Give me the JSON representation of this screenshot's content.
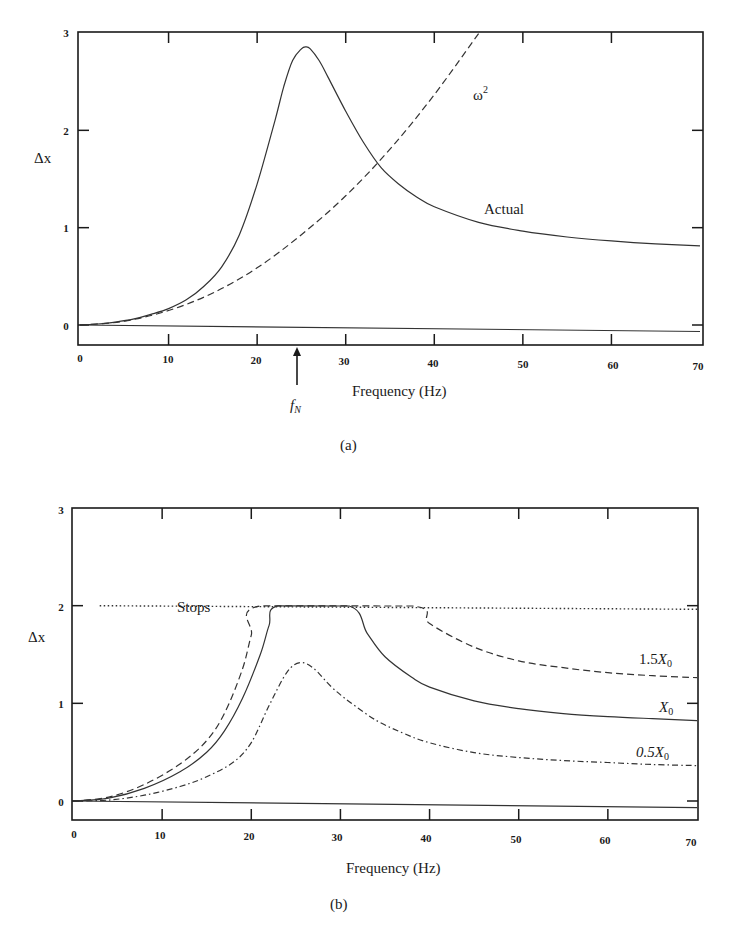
{
  "chart_data": [
    {
      "panel": "(a)",
      "type": "line",
      "title": "",
      "xlabel": "Frequency (Hz)",
      "ylabel": "Δx",
      "xlim": [
        0,
        70
      ],
      "ylim": [
        -0.2,
        3
      ],
      "xticks": [
        0,
        10,
        20,
        30,
        40,
        50,
        60,
        70
      ],
      "yticks": [
        0,
        1,
        2,
        3
      ],
      "grid": false,
      "annotations": [
        {
          "text": "ω²",
          "x": 42,
          "y": 2.55
        },
        {
          "text": "Actual",
          "x": 44,
          "y": 1.15
        },
        {
          "text": "f_N",
          "x": 25,
          "y": -0.6,
          "arrow": true
        }
      ],
      "series": [
        {
          "name": "Actual",
          "style": "solid",
          "x": [
            0,
            2,
            4,
            6,
            8,
            10,
            12,
            14,
            16,
            18,
            20,
            22,
            23,
            24,
            25,
            25.5,
            26,
            27,
            28,
            30,
            32,
            34,
            36,
            38,
            40,
            45,
            50,
            55,
            60,
            65,
            70
          ],
          "values": [
            0,
            0.01,
            0.03,
            0.06,
            0.11,
            0.17,
            0.26,
            0.4,
            0.6,
            0.93,
            1.45,
            2.1,
            2.45,
            2.72,
            2.84,
            2.86,
            2.84,
            2.72,
            2.55,
            2.2,
            1.88,
            1.62,
            1.45,
            1.32,
            1.22,
            1.06,
            0.97,
            0.91,
            0.87,
            0.84,
            0.82
          ]
        },
        {
          "name": "ω²",
          "style": "dashed",
          "x": [
            0,
            5,
            10,
            15,
            20,
            25,
            30,
            35,
            40,
            45
          ],
          "values": [
            0,
            0.04,
            0.15,
            0.33,
            0.59,
            0.93,
            1.33,
            1.81,
            2.37,
            3.0
          ]
        },
        {
          "name": "zero baseline",
          "style": "solid",
          "x": [
            0,
            70
          ],
          "values": [
            0,
            -0.06
          ]
        }
      ]
    },
    {
      "panel": "(b)",
      "type": "line",
      "title": "",
      "xlabel": "Frequency (Hz)",
      "ylabel": "Δx",
      "xlim": [
        0,
        70
      ],
      "ylim": [
        -0.2,
        3
      ],
      "xticks": [
        0,
        10,
        20,
        30,
        40,
        50,
        60,
        70
      ],
      "yticks": [
        0,
        1,
        2,
        3
      ],
      "grid": false,
      "annotations": [
        {
          "text": "Stops",
          "x": 15.5,
          "y": 2.0
        },
        {
          "text": "1.5X₀",
          "x": 66,
          "y": 1.45
        },
        {
          "text": "X₀",
          "x": 66,
          "y": 1.05
        },
        {
          "text": "0.5X₀",
          "x": 66,
          "y": 0.58
        }
      ],
      "series": [
        {
          "name": "Stops",
          "style": "dotted",
          "x": [
            3,
            70
          ],
          "values": [
            2.0,
            1.97
          ]
        },
        {
          "name": "1.5X₀",
          "style": "dashed",
          "x": [
            0,
            4,
            8,
            12,
            15,
            17,
            19,
            20,
            21,
            38,
            40,
            45,
            50,
            55,
            60,
            65,
            70
          ],
          "values": [
            0,
            0.04,
            0.17,
            0.38,
            0.62,
            0.9,
            1.35,
            1.7,
            2.0,
            2.0,
            1.82,
            1.58,
            1.44,
            1.37,
            1.32,
            1.29,
            1.27
          ]
        },
        {
          "name": "X₀",
          "style": "solid",
          "x": [
            0,
            4,
            8,
            12,
            15,
            17,
            19,
            21,
            22,
            23,
            31,
            33,
            35,
            38,
            40,
            45,
            50,
            55,
            60,
            65,
            70
          ],
          "values": [
            0,
            0.03,
            0.13,
            0.3,
            0.5,
            0.72,
            1.05,
            1.5,
            1.8,
            2.0,
            2.0,
            1.72,
            1.48,
            1.27,
            1.17,
            1.03,
            0.95,
            0.9,
            0.87,
            0.85,
            0.83
          ]
        },
        {
          "name": "0.5X₀",
          "style": "dashdot",
          "x": [
            0,
            4,
            8,
            12,
            15,
            18,
            20,
            22,
            24,
            25.5,
            27,
            29,
            31,
            34,
            37,
            40,
            45,
            50,
            55,
            60,
            65,
            70
          ],
          "values": [
            0,
            0.01,
            0.06,
            0.15,
            0.25,
            0.4,
            0.6,
            0.98,
            1.32,
            1.42,
            1.36,
            1.17,
            1.02,
            0.83,
            0.7,
            0.6,
            0.5,
            0.45,
            0.42,
            0.4,
            0.38,
            0.37
          ]
        },
        {
          "name": "zero baseline",
          "style": "solid",
          "x": [
            0,
            70
          ],
          "values": [
            0,
            -0.06
          ]
        }
      ]
    }
  ],
  "labels": {
    "panel_a": {
      "ylabel": "Δx",
      "xlabel": "Frequency (Hz)",
      "caption": "(a)",
      "omega_label": "ω",
      "omega_sup": "2",
      "actual_label": "Actual",
      "fn_label": "f",
      "fn_sub": "N",
      "xticks": [
        "0",
        "10",
        "20",
        "30",
        "40",
        "50",
        "60",
        "70"
      ],
      "yticks": [
        "0",
        "1",
        "2",
        "3"
      ]
    },
    "panel_b": {
      "ylabel": "Δx",
      "xlabel": "Frequency (Hz)",
      "caption": "(b)",
      "stops_label": "Stops",
      "s15_prefix": "1.5",
      "s10_prefix": "",
      "s05_prefix": "0.5",
      "x_sym": "X",
      "x_sub": "0",
      "xticks": [
        "0",
        "10",
        "20",
        "30",
        "40",
        "50",
        "60",
        "70"
      ],
      "yticks": [
        "0",
        "1",
        "2",
        "3"
      ]
    }
  }
}
